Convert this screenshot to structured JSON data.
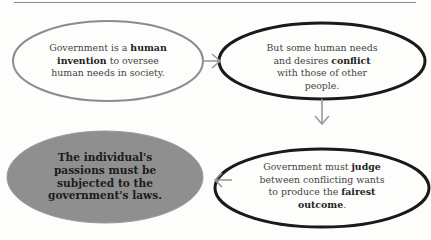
{
  "nodes": [
    {
      "id": "n1",
      "parts": [
        {
          "text": "Government is a ",
          "bold": false
        },
        {
          "text": "human invention",
          "bold": true
        },
        {
          "text": " to oversee human needs in society.",
          "bold": false
        }
      ]
    },
    {
      "id": "n2",
      "parts": [
        {
          "text": "But some human needs and desires ",
          "bold": false
        },
        {
          "text": "conflict",
          "bold": true
        },
        {
          "text": " with those of other people.",
          "bold": false
        }
      ]
    },
    {
      "id": "n3",
      "parts": [
        {
          "text": "Government must ",
          "bold": false
        },
        {
          "text": "judge",
          "bold": true
        },
        {
          "text": " between conflicting wants to produce the ",
          "bold": false
        },
        {
          "text": "fairest outcome",
          "bold": true
        },
        {
          "text": ".",
          "bold": false
        }
      ]
    },
    {
      "id": "n4",
      "parts": [
        {
          "text": "The individual's passions must be subjected to the government's laws.",
          "bold": true
        }
      ]
    }
  ],
  "edges": [
    {
      "from": "n1",
      "to": "n2",
      "direction": "right"
    },
    {
      "from": "n2",
      "to": "n3",
      "direction": "down"
    },
    {
      "from": "n3",
      "to": "n4",
      "direction": "left"
    }
  ],
  "colors": {
    "n1_stroke": "#8c8c8c",
    "n2_stroke": "#1a1a1a",
    "n3_stroke": "#1a1a1a",
    "n4_fill": "#8f8f8f",
    "arrow": "#9a9a9a"
  }
}
